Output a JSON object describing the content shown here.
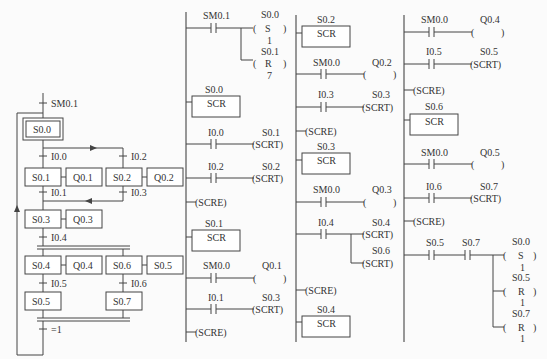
{
  "sfc": {
    "initial_transition": "SM0.1",
    "steps": {
      "s00": "S0.0",
      "s01": "S0.1",
      "s02": "S0.2",
      "s03": "S0.3",
      "s04": "S0.4",
      "s05": "S0.5",
      "s06": "S0.6",
      "s07": "S0.7"
    },
    "actions": {
      "a01": "Q0.1",
      "a02": "Q0.2",
      "a03": "Q0.3",
      "a04": "Q0.4",
      "a06": "S0.5"
    },
    "transitions": {
      "t00": "I0.0",
      "t02": "I0.2",
      "t01": "I0.1",
      "t03": "I0.3",
      "t04": "I0.4",
      "t05": "I0.5",
      "t06": "I0.6",
      "t_end": "=1"
    }
  },
  "ladder": {
    "col1": {
      "n1_contact": "SM0.1",
      "n1_coil1_addr": "S0.0",
      "n1_coil1_type": "S",
      "n1_coil1_n": "1",
      "n1_coil2_addr": "S0.1",
      "n1_coil2_type": "R",
      "n1_coil2_n": "7",
      "scr1_addr": "S0.0",
      "scr_label": "SCR",
      "c2_contact": "I0.0",
      "c2_coil_addr": "S0.1",
      "scrt": "(SCRT)",
      "c3_contact": "I0.2",
      "c3_coil_addr": "S0.2",
      "scre": "(SCRE)",
      "scr2_addr": "S0.1",
      "c4_contact": "SM0.0",
      "c4_coil_addr": "Q0.1",
      "c5_contact": "I0.1",
      "c5_coil_addr": "S0.3"
    },
    "col2": {
      "scr1_addr": "S0.2",
      "c1_contact": "SM0.0",
      "c1_coil_addr": "Q0.2",
      "c2_contact": "I0.3",
      "c2_coil_addr": "S0.3",
      "scr2_addr": "S0.3",
      "c3_contact": "SM0.0",
      "c3_coil_addr": "Q0.3",
      "c4_contact": "I0.4",
      "c4_coil1_addr": "S0.4",
      "c4_coil2_addr": "S0.6",
      "scr3_addr": "S0.4"
    },
    "col3": {
      "c1_contact": "SM0.0",
      "c1_coil_addr": "Q0.4",
      "c2_contact": "I0.5",
      "c2_coil_addr": "S0.5",
      "scr1_addr": "S0.6",
      "c3_contact": "SM0.0",
      "c3_coil_addr": "Q0.5",
      "c4_contact": "I0.6",
      "c4_coil_addr": "S0.7",
      "c5_contact1": "S0.5",
      "c5_contact2": "S0.7",
      "c5_coil1_addr": "S0.0",
      "c5_coil1_type": "S",
      "c5_coil1_n": "1",
      "c5_coil2_addr": "S0.5",
      "c5_coil2_type": "R",
      "c5_coil2_n": "1",
      "c5_coil3_addr": "S0.7",
      "c5_coil3_type": "R",
      "c5_coil3_n": "1"
    }
  }
}
